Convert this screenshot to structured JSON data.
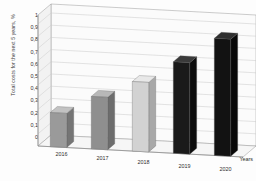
{
  "chart_data": {
    "type": "bar",
    "title": "",
    "subtitle": "",
    "categories": [
      "2016",
      "2017",
      "2018",
      "2019",
      "2020"
    ],
    "values": [
      0.28,
      0.43,
      0.57,
      0.75,
      0.96
    ],
    "xlabel": "Years",
    "ylabel": "Total costs for the next 5 years, %",
    "ylim": [
      0,
      1
    ],
    "ytick_labels": [
      "1",
      "0,9",
      "0,8",
      "0,7",
      "0,6",
      "0,5",
      "0,4",
      "0,3",
      "0,2",
      "0,1",
      "0"
    ],
    "ytick_values": [
      1,
      0.9,
      0.8,
      0.7,
      0.6,
      0.5,
      0.4,
      0.3,
      0.2,
      0.1,
      0
    ],
    "grid": true,
    "legend": false,
    "legend_position": "none",
    "style": "3d-column",
    "bar_colors": [
      "#9a9a9a",
      "#8f8f8f",
      "#d2d2d2",
      "#1a1a1a",
      "#121212"
    ],
    "bar_top_colors": [
      "#c2c2c2",
      "#b8b8b8",
      "#e8e8e8",
      "#3a3a3a",
      "#303030"
    ],
    "bar_side_colors": [
      "#757575",
      "#6d6d6d",
      "#a8a8a8",
      "#0d0d0d",
      "#080808"
    ],
    "plot_background": "#fbfbfb",
    "gridline_color": "#c8c8c8",
    "axis_color": "#9a9a9a"
  }
}
